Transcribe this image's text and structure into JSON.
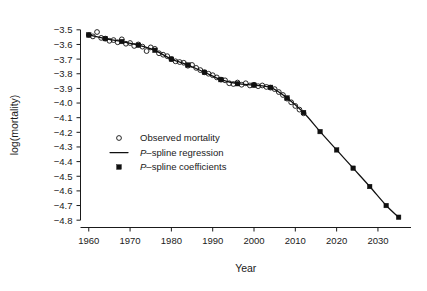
{
  "chart_data": {
    "type": "scatter",
    "title": "",
    "xlabel": "Year",
    "ylabel": "log(mortality)",
    "xlim": [
      1958,
      2038
    ],
    "ylim": [
      -4.85,
      -3.45
    ],
    "grid": false,
    "legend_position": "center-left",
    "x_ticks": [
      1960,
      1970,
      1980,
      1990,
      2000,
      2010,
      2020,
      2030
    ],
    "x_tick_labels": [
      "1960",
      "1970",
      "1980",
      "1990",
      "2000",
      "2010",
      "2020",
      "2030"
    ],
    "y_ticks": [
      -3.5,
      -3.6,
      -3.7,
      -3.8,
      -3.9,
      -4.0,
      -4.1,
      -4.2,
      -4.3,
      -4.4,
      -4.5,
      -4.6,
      -4.7,
      -4.8
    ],
    "y_tick_labels": [
      "-3.5",
      "-3.6",
      "-3.7",
      "-3.8",
      "-3.9",
      "-4.0",
      "-4.1",
      "-4.2",
      "-4.3",
      "-4.4",
      "-4.5",
      "-4.6",
      "-4.7",
      "-4.8"
    ],
    "series": [
      {
        "name": "Observed mortality",
        "type": "scatter",
        "marker": "open-circle",
        "x": [
          1960,
          1961,
          1962,
          1963,
          1964,
          1965,
          1966,
          1967,
          1968,
          1969,
          1970,
          1971,
          1972,
          1973,
          1974,
          1975,
          1976,
          1977,
          1978,
          1979,
          1980,
          1981,
          1982,
          1983,
          1984,
          1985,
          1986,
          1987,
          1988,
          1989,
          1990,
          1991,
          1992,
          1993,
          1994,
          1995,
          1996,
          1997,
          1998,
          1999,
          2000,
          2001,
          2002,
          2003,
          2004,
          2005,
          2006,
          2007,
          2008,
          2009,
          2010,
          2011,
          2012
        ],
        "y": [
          -3.535,
          -3.545,
          -3.515,
          -3.555,
          -3.56,
          -3.575,
          -3.57,
          -3.585,
          -3.565,
          -3.595,
          -3.59,
          -3.61,
          -3.6,
          -3.615,
          -3.645,
          -3.62,
          -3.63,
          -3.66,
          -3.67,
          -3.68,
          -3.7,
          -3.715,
          -3.72,
          -3.725,
          -3.745,
          -3.74,
          -3.76,
          -3.775,
          -3.79,
          -3.8,
          -3.81,
          -3.825,
          -3.84,
          -3.845,
          -3.865,
          -3.87,
          -3.86,
          -3.875,
          -3.865,
          -3.88,
          -3.875,
          -3.885,
          -3.88,
          -3.89,
          -3.895,
          -3.905,
          -3.925,
          -3.945,
          -3.97,
          -3.995,
          -4.02,
          -4.045,
          -4.07
        ]
      },
      {
        "name": "P-spline regression",
        "type": "line",
        "x": [
          1960,
          1964,
          1968,
          1972,
          1976,
          1980,
          1984,
          1988,
          1992,
          1996,
          2000,
          2004,
          2008,
          2012,
          2016,
          2020,
          2024,
          2028,
          2032,
          2035
        ],
        "y": [
          -3.535,
          -3.56,
          -3.58,
          -3.605,
          -3.64,
          -3.7,
          -3.74,
          -3.79,
          -3.84,
          -3.868,
          -3.878,
          -3.893,
          -3.965,
          -4.065,
          -4.195,
          -4.32,
          -4.445,
          -4.57,
          -4.7,
          -4.78
        ]
      },
      {
        "name": "P-spline coefficients",
        "type": "scatter",
        "marker": "filled-square",
        "x": [
          1960,
          1964,
          1968,
          1972,
          1976,
          1980,
          1984,
          1988,
          1992,
          1996,
          2000,
          2004,
          2008,
          2012,
          2016,
          2020,
          2024,
          2028,
          2032,
          2035
        ],
        "y": [
          -3.535,
          -3.56,
          -3.58,
          -3.605,
          -3.64,
          -3.7,
          -3.74,
          -3.79,
          -3.84,
          -3.868,
          -3.878,
          -3.893,
          -3.965,
          -4.065,
          -4.195,
          -4.32,
          -4.445,
          -4.57,
          -4.7,
          -4.78
        ]
      }
    ],
    "legend_entries": [
      {
        "label": "Observed mortality",
        "marker": "open-circle",
        "italic_prefix": ""
      },
      {
        "label": "-spline regression",
        "marker": "line",
        "italic_prefix": "P"
      },
      {
        "label": "-spline coefficients",
        "marker": "filled-square",
        "italic_prefix": "P"
      }
    ],
    "colors": {
      "line": "#101010",
      "marker": "#101010",
      "text": "#1a1a1a",
      "background": "#ffffff"
    }
  }
}
